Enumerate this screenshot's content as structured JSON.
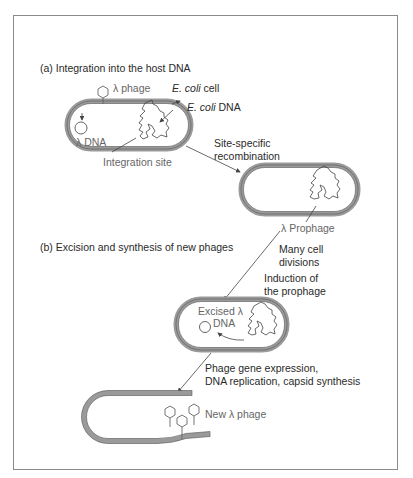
{
  "sections": {
    "a": "(a) Integration into the host DNA",
    "b": "(b) Excision and synthesis of new phages"
  },
  "labels": {
    "lambda_phage": "λ phage",
    "ecoli_cell_italic": "E. coli",
    "ecoli_cell_rest": " cell",
    "ecoli_dna_italic": "E. coli",
    "ecoli_dna_rest": " DNA",
    "lambda_dna": "λ DNA",
    "integration_site": "Integration site",
    "site_specific_1": "Site-specific",
    "site_specific_2": "recombination",
    "prophage": "λ Prophage",
    "many_cell_1": "Many cell",
    "many_cell_2": "divisions",
    "induction_1": "Induction of",
    "induction_2": "the prophage",
    "excised_1": "Excised λ",
    "excised_2": "DNA",
    "phage_expr_1": "Phage gene expression,",
    "phage_expr_2": "DNA replication, capsid synthesis",
    "new_phage": "New λ phage"
  },
  "colors": {
    "cell_wall": "#9a9a9a",
    "frame": "#8a8a8a",
    "line": "#444444"
  }
}
